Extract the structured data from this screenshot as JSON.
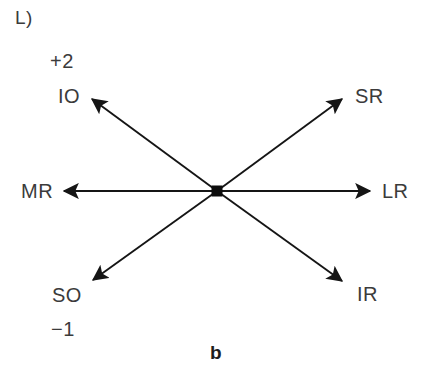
{
  "figure": {
    "panel_label": "L)",
    "caption": "b",
    "background_color": "#ffffff",
    "line_color": "#151515",
    "text_color": "#3b3b3b",
    "center_point": {
      "x": 217,
      "y": 191
    }
  },
  "grades": {
    "upper": "+2",
    "lower": "−1"
  },
  "muscles": [
    {
      "abbr": "IO",
      "direction": "up-left",
      "tip": {
        "x": 89,
        "y": 96
      }
    },
    {
      "abbr": "SR",
      "direction": "up-right",
      "tip": {
        "x": 345,
        "y": 96
      }
    },
    {
      "abbr": "MR",
      "direction": "left",
      "tip": {
        "x": 62,
        "y": 191
      }
    },
    {
      "abbr": "LR",
      "direction": "right",
      "tip": {
        "x": 372,
        "y": 191
      }
    },
    {
      "abbr": "SO",
      "direction": "down-left",
      "tip": {
        "x": 90,
        "y": 282
      }
    },
    {
      "abbr": "IR",
      "direction": "down-right",
      "tip": {
        "x": 345,
        "y": 283
      }
    }
  ]
}
